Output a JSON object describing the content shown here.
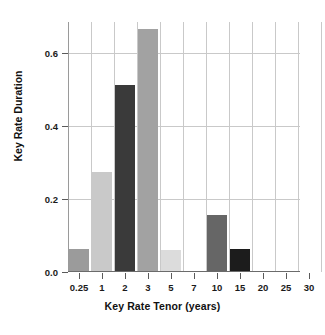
{
  "chart_data": {
    "type": "bar",
    "title": "",
    "subtitle": "",
    "xlabel": "Key Rate Tenor (years)",
    "ylabel": "Key Rate Duration",
    "categories": [
      "0.25",
      "1",
      "2",
      "3",
      "5",
      "7",
      "10",
      "15",
      "20",
      "25",
      "30"
    ],
    "values": [
      0.062,
      0.273,
      0.513,
      0.665,
      0.06,
      0.0,
      0.155,
      0.062,
      0.0,
      0.0,
      0.0
    ],
    "bar_colors": [
      "#9b9b9b",
      "#c9c9c9",
      "#3a3a3a",
      "#a2a2a2",
      "#dcdcdc",
      "#ffffff",
      "#666666",
      "#1c1c1c",
      "#ffffff",
      "#ffffff",
      "#ffffff"
    ],
    "ylim": [
      0.0,
      0.685
    ],
    "yticks": [
      0.0,
      0.2,
      0.4,
      0.6
    ],
    "ytick_labels": [
      "0.0",
      "0.2",
      "0.4",
      "0.6"
    ],
    "xtick_labels": [
      "0.25",
      "1",
      "2",
      "3",
      "5",
      "7",
      "10",
      "15",
      "20",
      "25",
      "30"
    ],
    "grid": true,
    "grid_color": "#c9c9c9",
    "legend": "none",
    "background": "#ffffff",
    "axis_color": "#5a5a5a"
  }
}
